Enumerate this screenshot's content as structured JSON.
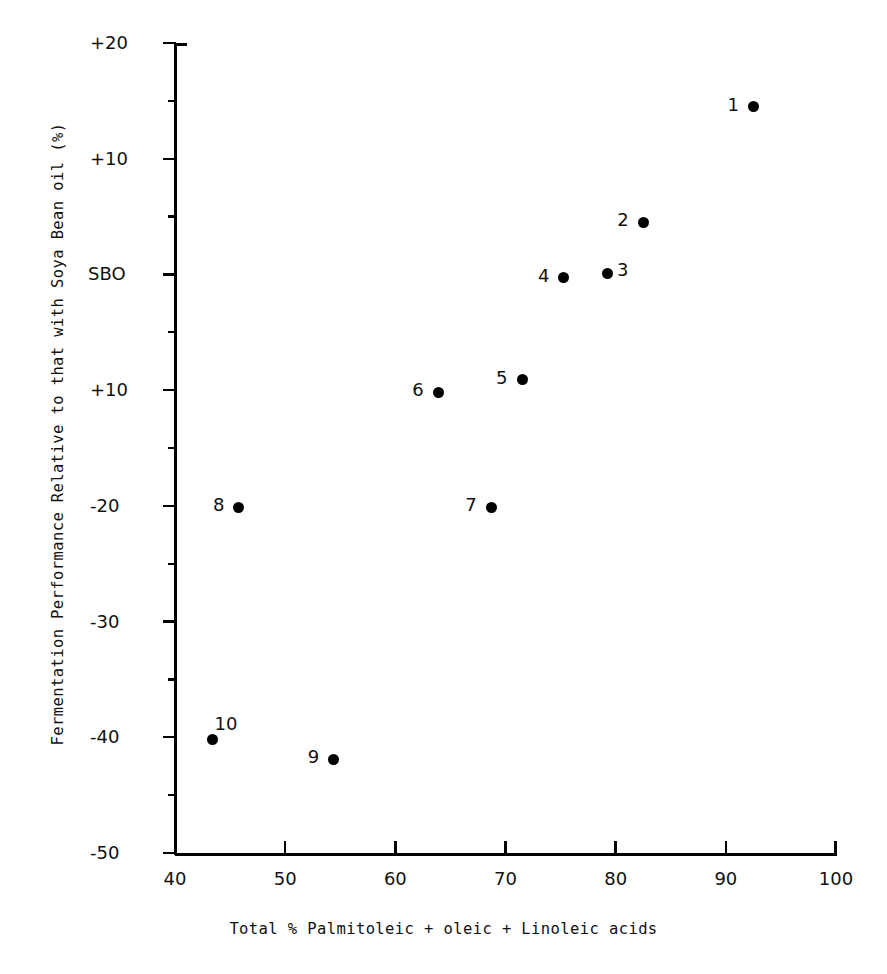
{
  "chart_data": {
    "type": "scatter",
    "title": "",
    "xlabel": "Total % Palmitoleic + oleic + Linoleic acids",
    "ylabel": "Fermentation Performance Relative to that with Soya Bean oil (%)",
    "xlim": [
      40,
      100
    ],
    "ylim": [
      -50,
      20
    ],
    "grid": false,
    "legend": "none",
    "xticks": [
      {
        "value": 40,
        "label": "40"
      },
      {
        "value": 50,
        "label": "50"
      },
      {
        "value": 60,
        "label": "60"
      },
      {
        "value": 70,
        "label": "70"
      },
      {
        "value": 80,
        "label": "80"
      },
      {
        "value": 90,
        "label": "90"
      },
      {
        "value": 100,
        "label": "100"
      }
    ],
    "yticks": [
      {
        "value": 20,
        "label": "+20"
      },
      {
        "value": 10,
        "label": "+10"
      },
      {
        "value": 0,
        "label": "SBO"
      },
      {
        "value": -10,
        "label": "+10"
      },
      {
        "value": -20,
        "label": "-20"
      },
      {
        "value": -30,
        "label": "-30"
      },
      {
        "value": -40,
        "label": "-40"
      },
      {
        "value": -50,
        "label": "-50"
      }
    ],
    "yminorticks": [
      15,
      5,
      -5,
      -15,
      -25,
      -35,
      -45
    ],
    "points": [
      {
        "label": "1",
        "x": 92.5,
        "y": 14.5,
        "label_pos": "left"
      },
      {
        "label": "2",
        "x": 82.5,
        "y": 4.5,
        "label_pos": "left"
      },
      {
        "label": "3",
        "x": 79.3,
        "y": 0.1,
        "label_pos": "right"
      },
      {
        "label": "4",
        "x": 75.3,
        "y": -0.3,
        "label_pos": "left"
      },
      {
        "label": "5",
        "x": 71.5,
        "y": -9.1,
        "label_pos": "left"
      },
      {
        "label": "6",
        "x": 63.9,
        "y": -10.2,
        "label_pos": "left"
      },
      {
        "label": "7",
        "x": 68.7,
        "y": -20.1,
        "label_pos": "left"
      },
      {
        "label": "8",
        "x": 45.8,
        "y": -20.1,
        "label_pos": "left"
      },
      {
        "label": "9",
        "x": 54.4,
        "y": -41.9,
        "label_pos": "left"
      },
      {
        "label": "10",
        "x": 43.4,
        "y": -40.2,
        "label_pos": "above-right"
      }
    ]
  }
}
